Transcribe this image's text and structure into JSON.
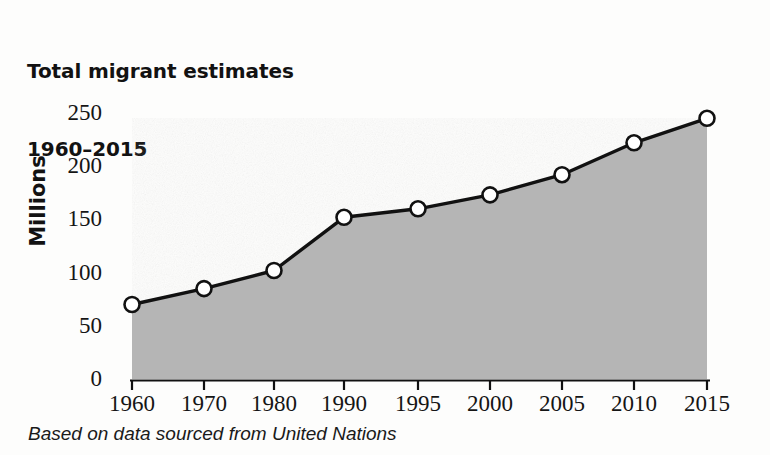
{
  "title": {
    "line1": "Total migrant estimates",
    "line2": "1960–2015"
  },
  "caption": "Based on data sourced from United Nations",
  "axes": {
    "y_title": "Millions",
    "y_ticks": [
      "0",
      "50",
      "100",
      "150",
      "200",
      "250"
    ],
    "x_ticks": [
      "1960",
      "1970",
      "1980",
      "1990",
      "1995",
      "2000",
      "2005",
      "2010",
      "2015"
    ]
  },
  "colors": {
    "area_fill": "#b5b5b5",
    "line": "#111111",
    "marker_face": "#ffffff",
    "marker_edge": "#111111",
    "axis": "#111111",
    "text": "#121212",
    "background": "#fdfdfc"
  },
  "chart_data": {
    "type": "area",
    "title": "Total migrant estimates 1960–2015",
    "subtitle": "",
    "xlabel": "",
    "ylabel": "Millions",
    "categories": [
      "1960",
      "1970",
      "1980",
      "1990",
      "1995",
      "2000",
      "2005",
      "2010",
      "2015"
    ],
    "values": [
      70,
      85,
      102,
      152,
      160,
      173,
      192,
      222,
      245
    ],
    "series": [
      {
        "name": "Total migrant estimates",
        "values": [
          70,
          85,
          102,
          152,
          160,
          173,
          192,
          222,
          245
        ]
      }
    ],
    "ylim": [
      0,
      250
    ],
    "yticks": [
      0,
      50,
      100,
      150,
      200,
      250
    ],
    "grid": false,
    "legend": false,
    "markers": "open-circle",
    "fill": true,
    "source_note": "Based on data sourced from United Nations"
  }
}
